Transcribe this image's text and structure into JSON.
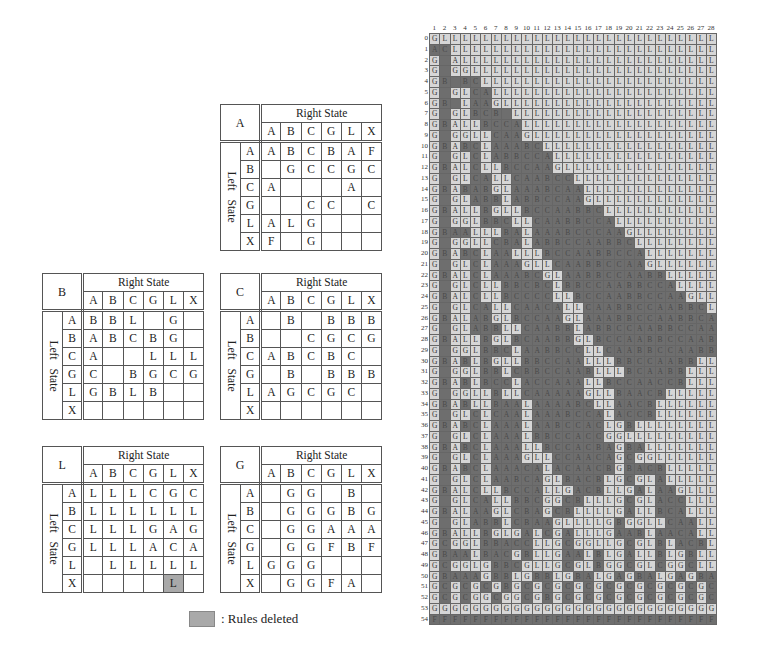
{
  "tables": {
    "labels": {
      "right_state": "Right   State",
      "left_state": "Left  State"
    },
    "columns": [
      "A",
      "B",
      "C",
      "G",
      "L",
      "X"
    ],
    "rows": [
      "A",
      "B",
      "C",
      "G",
      "L",
      "X"
    ],
    "A": {
      "name": "A",
      "cells": [
        [
          "A",
          "B",
          "C",
          "B",
          "A",
          "F"
        ],
        [
          "",
          "G",
          "C",
          "C",
          "G",
          "C"
        ],
        [
          "A",
          "",
          "",
          "",
          "A",
          ""
        ],
        [
          "",
          "",
          "C",
          "C",
          "",
          "C"
        ],
        [
          "A",
          "L",
          "G",
          "",
          "",
          ""
        ],
        [
          "F",
          "",
          "G",
          "",
          "",
          ""
        ]
      ]
    },
    "B": {
      "name": "B",
      "cells": [
        [
          "B",
          "B",
          "L",
          "",
          "G",
          ""
        ],
        [
          "A",
          "B",
          "C",
          "B",
          "G",
          ""
        ],
        [
          "A",
          "",
          "",
          "L",
          "L",
          "L"
        ],
        [
          "C",
          "",
          "B",
          "G",
          "C",
          "G"
        ],
        [
          "G",
          "B",
          "L",
          "B",
          "",
          ""
        ],
        [
          "",
          "",
          "",
          "",
          "",
          ""
        ]
      ]
    },
    "C": {
      "name": "C",
      "cells": [
        [
          "",
          "B",
          "",
          "B",
          "B",
          "B"
        ],
        [
          "",
          "",
          "C",
          "G",
          "C",
          "G"
        ],
        [
          "A",
          "B",
          "C",
          "B",
          "C",
          ""
        ],
        [
          "",
          "B",
          "",
          "B",
          "B",
          "B"
        ],
        [
          "A",
          "G",
          "C",
          "G",
          "C",
          ""
        ],
        [
          "",
          "",
          "",
          "",
          "",
          ""
        ]
      ]
    },
    "L": {
      "name": "L",
      "cells": [
        [
          "L",
          "L",
          "L",
          "C",
          "G",
          "C"
        ],
        [
          "L",
          "L",
          "L",
          "L",
          "L",
          "L"
        ],
        [
          "L",
          "L",
          "L",
          "G",
          "A",
          "G"
        ],
        [
          "L",
          "L",
          "L",
          "A",
          "C",
          "A"
        ],
        [
          "",
          "L",
          "L",
          "L",
          "L",
          "L"
        ],
        [
          "",
          "",
          "",
          "",
          "L",
          ""
        ]
      ],
      "deleted": [
        [
          5,
          4
        ]
      ]
    },
    "G": {
      "name": "G",
      "cells": [
        [
          "",
          "G",
          "G",
          "",
          "B",
          ""
        ],
        [
          "",
          "G",
          "G",
          "G",
          "B",
          "G"
        ],
        [
          "",
          "G",
          "G",
          "A",
          "A",
          "A"
        ],
        [
          "",
          "G",
          "G",
          "F",
          "B",
          "F"
        ],
        [
          "G",
          "G",
          "G",
          "",
          "",
          ""
        ],
        [
          "",
          "G",
          "G",
          "F",
          "A",
          ""
        ]
      ]
    }
  },
  "legend": {
    "label": ": Rules deleted",
    "color": "#a9a9a9"
  },
  "diagram": {
    "columns": 28,
    "rows_count": 55,
    "col_numbers": [
      "1",
      "2",
      "3",
      "4",
      "5",
      "6",
      "7",
      "8",
      "9",
      "10",
      "11",
      "12",
      "13",
      "14",
      "15",
      "16",
      "17",
      "18",
      "19",
      "20",
      "21",
      "22",
      "23",
      "24",
      "25",
      "26",
      "27",
      "28"
    ],
    "row_numbers_start": 0,
    "colors": {
      "light": "#d6d6d6",
      "dark": "#6e6e6e"
    },
    "legend_note": "lowercase/dot = dark cell; uppercase = light cell",
    "rows": [
      "GLLLLLLLLLLLLLLLLLLLLLLLLLLL",
      "acLLLLLLLLLLLLLLLLLLLLLLLLLL",
      "G.ALLLLLLLLLLLLLLLLLLLLLLLLL",
      "G.GGLLLLLLLLLLLLLLLLLLLLLLLL",
      "Gb.bcLLLLLLLLLLLLLLLLLLLLLLL",
      "G.GLcaLLLLLLLLLLLLLLLLLLLLLL",
      "Gb.LaaGLLLLLLLLLLLLLLLLLLLLL",
      "G.GLbcb.LLLLLLLLLLLLLLLLLLLL",
      "GbALLbccaLLLLLLLLLLLLLLLLLLL",
      "G.GGLLcaaGLLLLLLLLLLLLLLLLLL",
      "GbAbcLaaabcLLLLLLLLLLLLLLLLL",
      "G.GLcLabbccaLLLLLLLLLLLLLLLL",
      "GbALcLLbccaaGLLLLLLLLLLLLLLL",
      "G.GLcaLLcaabccLLLLLLLLLLLLLL",
      "GbAbabGLaaabcaaLLLLLLLLLLLLL",
      "G.GLabbLabbccaaGLLLLLLLLLLLL",
      "GbALLbGLLbccaabbcLLLLLLLLLLL",
      "G.GGLbbcLLcaabbccaLLLLLLLLLL",
      "GbaaLLLbaLaaabcccaaGLLLLLLLL",
      "G.GGLLcbaLabbccaabbcLLLLLLLL",
      "GbAbcLaaLLLbccaabbccaLLLLLLL",
      "G.GLcLaaaGLLcaabbccaaGLLLLLL",
      "GbALcLaaabcGLaabbccaabbLLLLL",
      "G.GLcLLbbcbcLbbccaabbccaLLLL",
      "GbALcLLbccccLLbccaabbccaaGLL",
      "G.GLcaLLcaacaLLcaabbccaabbcL",
      "GbALabGLbccaaGLaaabbccaabbca",
      "G.GLabbLLcaabbLabbccaabbccaa",
      "GbALLbGLbcaabbGLbccaabbccaab",
      "G.GGLbbcLaabbccLLcaabbccaabb",
      "GbAbLbGLLbbccaaLLLbbccaabbLL",
      "G.GGLbbLcbbccaabLLLbcaabbLLL",
      "GbAbLbccLaccaaaLLbccaaccbLLL",
      "G.GGLLbLLcaaaaaGLLbaacbLLLLL",
      "GbAbLLbaaLaaaabcLLaacbLLLLLL",
      "G.GLcLcaaLaaabccaLaccbLLLLLL",
      "GbAbcLaaaLaabccacLGbLLLLLLLL",
      "G.GLcLaaaLbbccaccGGLLLLLLLLL",
      "GbAbcLaaaLLbccacbaGbaLLLLLLL",
      "G.GLcLaaaGLLccaacaGcGGLLLLLL",
      "GbAbcLaaacaLacaacbGbacbLLLLL",
      "G.GLcLaabcaGLbacbLGcGLaLLLLL",
      "GbALcLLbccaLLGacbLLGaLaaGLLL",
      "G.GLcaLLbbcGGcbLLLGcGLaccLLL",
      "GbALaaGLcbaGcbLLLLGaLLbcaLLL",
      "G.GLabbLcbaaGLLLLGbGGLLcaaLL",
      "GbALLbGLGaLcGaLLLGaabLaacaLL",
      "GcGGLbbaccLLGcGGLLGcGLbLacbL",
      "GbaaLbacGbLLGaaLbLGaLLbLGbLL",
      "GcGGLGbbcGLLGcGLbGGcGLcGGcLL",
      "GbaaaGbbLGbbLGbaLGaGbaLGaGba",
      "GcGcGcGbGcGcGcGcGcGcGcGcGcGc",
      "GcGcGGcGGcGbGcGcGcGcGcGcGcGc",
      "GGGGGGGGGGGGGGGGGGGGGGGGGGGG",
      "ffffffffffffffffffffffffffff"
    ]
  }
}
